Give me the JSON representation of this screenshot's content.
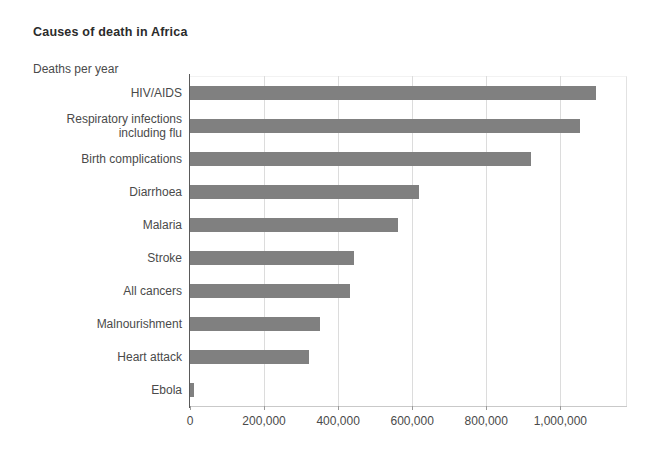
{
  "chart_data": {
    "type": "bar",
    "orientation": "horizontal",
    "title": "Causes of death in Africa",
    "subtitle": "Deaths per year",
    "xlabel": "",
    "ylabel": "",
    "grid": true,
    "legend": false,
    "xlim": [
      0,
      1180000
    ],
    "xticks": [
      0,
      200000,
      400000,
      600000,
      800000,
      1000000
    ],
    "xtick_labels": [
      "0",
      "200,000",
      "400,000",
      "600,000",
      "800,000",
      "1,000,000"
    ],
    "bar_color": "#808080",
    "categories": [
      "HIV/AIDS",
      "Respiratory infections including flu",
      "Birth complications",
      "Diarrhoea",
      "Malaria",
      "Stroke",
      "All cancers",
      "Malnourishment",
      "Heart attack",
      "Ebola"
    ],
    "category_label_lines": [
      [
        "HIV/AIDS"
      ],
      [
        "Respiratory infections",
        "including flu"
      ],
      [
        "Birth complications"
      ],
      [
        "Diarrhoea"
      ],
      [
        "Malaria"
      ],
      [
        "Stroke"
      ],
      [
        "All cancers"
      ],
      [
        "Malnourishment"
      ],
      [
        "Heart attack"
      ],
      [
        "Ebola"
      ]
    ],
    "values": [
      1097000,
      1054000,
      922000,
      619000,
      562000,
      443000,
      432000,
      351000,
      322000,
      11000
    ]
  }
}
